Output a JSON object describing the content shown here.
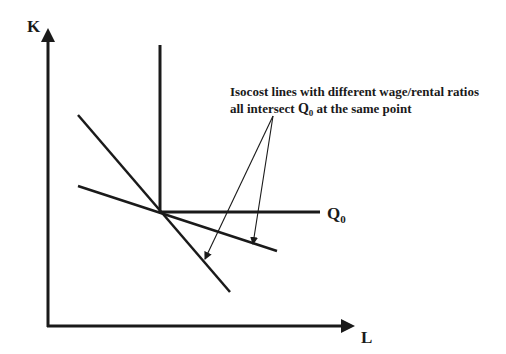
{
  "diagram": {
    "type": "economics-isoquant",
    "axes": {
      "y_label": "K",
      "x_label": "L"
    },
    "isoquant": {
      "label_main": "Q",
      "label_sub": "0",
      "shape": "right-angle (fixed proportions)"
    },
    "isocost_lines": [
      {
        "name": "steep-isocost",
        "description": "higher wage/rental ratio"
      },
      {
        "name": "flat-isocost",
        "description": "lower wage/rental ratio"
      }
    ],
    "annotation": {
      "line1": "Isocost lines with different wage/rental ratios",
      "line2_prefix": "all intersect ",
      "line2_q": "Q",
      "line2_sub": "0",
      "line2_suffix": " at the same point"
    },
    "colors": {
      "ink": "#1a1a1a",
      "background": "#ffffff"
    }
  }
}
